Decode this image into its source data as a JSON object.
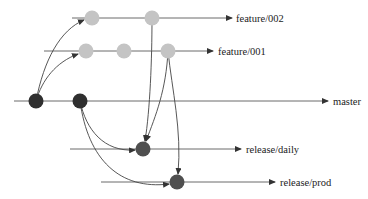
{
  "diagram": {
    "colors": {
      "master_commit": "#2f2f2f",
      "feature_commit": "#c4c4c4",
      "release_commit": "#4f4f4f",
      "line": "#6a6a6a",
      "arrow": "#444444",
      "text": "#222222"
    },
    "branches": [
      {
        "id": "feature-002",
        "label": "feature/002",
        "y": 18,
        "x_start": 72,
        "x_end": 232,
        "label_x": 236
      },
      {
        "id": "feature-001",
        "label": "feature/001",
        "y": 51,
        "x_start": 44,
        "x_end": 213,
        "label_x": 218
      },
      {
        "id": "master",
        "label": "master",
        "y": 101,
        "x_start": 14,
        "x_end": 328,
        "label_x": 333
      },
      {
        "id": "release-daily",
        "label": "release/daily",
        "y": 149,
        "x_start": 70,
        "x_end": 241,
        "label_x": 246
      },
      {
        "id": "release-prod",
        "label": "release/prod",
        "y": 182,
        "x_start": 101,
        "x_end": 275,
        "label_x": 280
      }
    ],
    "commits": [
      {
        "id": "m1",
        "branch": "master",
        "x": 36,
        "y": 101,
        "kind": "master"
      },
      {
        "id": "m2",
        "branch": "master",
        "x": 80,
        "y": 101,
        "kind": "master"
      },
      {
        "id": "f2a",
        "branch": "feature/002",
        "x": 92,
        "y": 18,
        "kind": "feature"
      },
      {
        "id": "f2b",
        "branch": "feature/002",
        "x": 152,
        "y": 18,
        "kind": "feature"
      },
      {
        "id": "f1a",
        "branch": "feature/001",
        "x": 86,
        "y": 51,
        "kind": "feature"
      },
      {
        "id": "f1b",
        "branch": "feature/001",
        "x": 124,
        "y": 51,
        "kind": "feature"
      },
      {
        "id": "f1c",
        "branch": "feature/001",
        "x": 168,
        "y": 51,
        "kind": "feature"
      },
      {
        "id": "rd1",
        "branch": "release/daily",
        "x": 143,
        "y": 149,
        "kind": "release"
      },
      {
        "id": "rp1",
        "branch": "release/prod",
        "x": 177,
        "y": 182,
        "kind": "release"
      }
    ],
    "edges": [
      {
        "from": "m1",
        "to": "f2a",
        "path": "M36,101 C44,60 60,30 84,20"
      },
      {
        "from": "m1",
        "to": "f1a",
        "path": "M36,101 C42,80 56,62 78,54"
      },
      {
        "from": "m2",
        "to": "rd1",
        "path": "M80,101 C86,130 104,152 135,150"
      },
      {
        "from": "m2",
        "to": "rp1",
        "path": "M80,101 C88,160 120,190 169,184"
      },
      {
        "from": "f2b",
        "to": "rd1",
        "path": "M152,18 C152,60 150,110 145,141"
      },
      {
        "from": "f1c",
        "to": "rd1",
        "path": "M168,51 C166,90 156,115 146,141"
      },
      {
        "from": "f1c",
        "to": "rp1",
        "path": "M168,51 C172,90 182,130 178,174"
      }
    ]
  }
}
